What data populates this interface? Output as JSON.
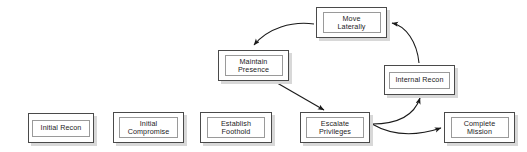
{
  "diagram": {
    "type": "flowchart",
    "canvas": {
      "width": 527,
      "height": 152,
      "background": "#ffffff"
    },
    "style": {
      "node_border_color": "#4a4a4a",
      "node_inner_border_color": "#9a9a9a",
      "node_shadow_color": "#d8d8d8",
      "node_fill": "#ffffff",
      "arrow_color": "#1a1a1a",
      "text_color": "#1d1d1d"
    },
    "nodes": [
      {
        "id": "initial-recon",
        "label": "Initial Recon",
        "x": 28,
        "y": 113,
        "w": 66,
        "h": 30,
        "inner_w": 58,
        "inner_h": 17
      },
      {
        "id": "initial-compromise",
        "label": "Initial\nCompromise",
        "x": 113,
        "y": 112,
        "w": 71,
        "h": 31,
        "inner_w": 59,
        "inner_h": 21
      },
      {
        "id": "establish-foothold",
        "label": "Establish\nFoothold",
        "x": 200,
        "y": 112,
        "w": 72,
        "h": 31,
        "inner_w": 58,
        "inner_h": 21
      },
      {
        "id": "escalate-privileges",
        "label": "Escalate\nPrivileges",
        "x": 300,
        "y": 112,
        "w": 70,
        "h": 31,
        "inner_w": 58,
        "inner_h": 21
      },
      {
        "id": "complete-mission",
        "label": "Complete\nMission",
        "x": 444,
        "y": 112,
        "w": 71,
        "h": 31,
        "inner_w": 58,
        "inner_h": 21
      },
      {
        "id": "maintain-presence",
        "label": "Maintain\nPresence",
        "x": 218,
        "y": 50,
        "w": 71,
        "h": 31,
        "inner_w": 58,
        "inner_h": 21
      },
      {
        "id": "move-laterally",
        "label": "Move\nLaterally",
        "x": 316,
        "y": 7,
        "w": 71,
        "h": 31,
        "inner_w": 58,
        "inner_h": 21
      },
      {
        "id": "internal-recon",
        "label": "Internal Recon",
        "x": 384,
        "y": 65,
        "w": 71,
        "h": 30,
        "inner_w": 61,
        "inner_h": 17
      }
    ],
    "edges": [
      {
        "id": "move-laterally-to-maintain-presence",
        "from": "move-laterally",
        "to": "maintain-presence",
        "path": "M 314 24 C 292 21 268 28 254 45",
        "arrowhead": true
      },
      {
        "id": "maintain-presence-to-escalate-privileges",
        "from": "maintain-presence",
        "to": "escalate-privileges",
        "path": "M 272 80 L 324 110",
        "arrowhead": true
      },
      {
        "id": "escalate-privileges-to-internal-recon",
        "from": "escalate-privileges",
        "to": "internal-recon",
        "path": "M 372 124 C 398 124 414 116 420 98",
        "arrowhead": true
      },
      {
        "id": "escalate-privileges-to-complete-mission",
        "from": "escalate-privileges",
        "to": "complete-mission",
        "path": "M 372 124 C 396 138 420 135 441 128",
        "arrowhead": true
      },
      {
        "id": "internal-recon-to-move-laterally",
        "from": "internal-recon",
        "to": "move-laterally",
        "path": "M 419 63 C 417 42 406 26 392 23",
        "arrowhead": true
      }
    ]
  }
}
